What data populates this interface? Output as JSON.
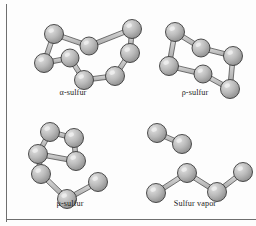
{
  "figure": {
    "background_color": "#fdfdfd",
    "rule_color": "#6e6e6e",
    "atom_color_light": "#e2e2e2",
    "atom_color_mid": "#b9b9b9",
    "atom_color_dark": "#8d8d8d",
    "atom_outline_color": "#3b3b3b",
    "bond_color_light": "#dcdcdc",
    "bond_color_dark": "#a6a6a6",
    "bond_outline_color": "#4a4a4a"
  },
  "panels": [
    {
      "id": "alpha-sulfur",
      "caption": "α-sulfur",
      "molecule": "S8 crown ring",
      "atom_count": 8,
      "atoms": [
        {
          "id": "a1",
          "cx": 36,
          "cy": 26,
          "r": 9.5
        },
        {
          "id": "a2",
          "cx": 26,
          "cy": 55,
          "r": 9.5
        },
        {
          "id": "a3",
          "cx": 52,
          "cy": 50,
          "r": 9.0
        },
        {
          "id": "a4",
          "cx": 66,
          "cy": 72,
          "r": 9.5
        },
        {
          "id": "a5",
          "cx": 97,
          "cy": 68,
          "r": 9.5
        },
        {
          "id": "a6",
          "cx": 112,
          "cy": 45,
          "r": 9.5
        },
        {
          "id": "a7",
          "cx": 71,
          "cy": 38,
          "r": 9.0
        },
        {
          "id": "a8",
          "cx": 114,
          "cy": 21,
          "r": 9.5
        }
      ],
      "bonds": [
        [
          "a1",
          "a2"
        ],
        [
          "a2",
          "a3"
        ],
        [
          "a3",
          "a4"
        ],
        [
          "a4",
          "a5"
        ],
        [
          "a5",
          "a6"
        ],
        [
          "a6",
          "a8"
        ],
        [
          "a8",
          "a7"
        ],
        [
          "a7",
          "a1"
        ]
      ]
    },
    {
      "id": "rho-sulfur",
      "caption": "ρ-sulfur",
      "molecule": "S6 chair ring",
      "atom_count": 6,
      "atoms": [
        {
          "id": "b1",
          "cx": 30,
          "cy": 24,
          "r": 9.5
        },
        {
          "id": "b2",
          "cx": 24,
          "cy": 58,
          "r": 9.5
        },
        {
          "id": "b3",
          "cx": 58,
          "cy": 66,
          "r": 9.0
        },
        {
          "id": "b4",
          "cx": 85,
          "cy": 81,
          "r": 9.5
        },
        {
          "id": "b5",
          "cx": 88,
          "cy": 48,
          "r": 9.5
        },
        {
          "id": "b6",
          "cx": 56,
          "cy": 40,
          "r": 9.0
        }
      ],
      "bonds": [
        [
          "b1",
          "b2"
        ],
        [
          "b2",
          "b3"
        ],
        [
          "b3",
          "b4"
        ],
        [
          "b4",
          "b5"
        ],
        [
          "b5",
          "b6"
        ],
        [
          "b6",
          "b1"
        ]
      ]
    },
    {
      "id": "mu-sulfur",
      "caption": "μ-sulfur",
      "molecule": "helical polymeric chain",
      "atom_count": 7,
      "atoms": [
        {
          "id": "c1",
          "cx": 28,
          "cy": 16,
          "r": 9.5
        },
        {
          "id": "c2",
          "cx": 16,
          "cy": 38,
          "r": 9.5
        },
        {
          "id": "c3",
          "cx": 52,
          "cy": 22,
          "r": 9.5
        },
        {
          "id": "c4",
          "cx": 54,
          "cy": 45,
          "r": 9.5
        },
        {
          "id": "c5",
          "cx": 19,
          "cy": 58,
          "r": 9.5
        },
        {
          "id": "c6",
          "cx": 45,
          "cy": 83,
          "r": 9.5
        },
        {
          "id": "c7",
          "cx": 76,
          "cy": 66,
          "r": 9.5
        }
      ],
      "bonds": [
        [
          "c1",
          "c2"
        ],
        [
          "c2",
          "c4"
        ],
        [
          "c3",
          "c4"
        ],
        [
          "c2",
          "c5"
        ],
        [
          "c5",
          "c6"
        ],
        [
          "c6",
          "c7"
        ],
        [
          "c3",
          "c1"
        ]
      ]
    },
    {
      "id": "sulfur-vapor",
      "caption": "Sulfur vapor",
      "molecule": "S2 diatomic and S4 chain",
      "atom_count": 6,
      "atoms": [
        {
          "id": "d1",
          "cx": 14,
          "cy": 17,
          "r": 9.5
        },
        {
          "id": "d2",
          "cx": 39,
          "cy": 28,
          "r": 9.5
        },
        {
          "id": "d3",
          "cx": 13,
          "cy": 77,
          "r": 9.5
        },
        {
          "id": "d4",
          "cx": 44,
          "cy": 57,
          "r": 9.5
        },
        {
          "id": "d5",
          "cx": 74,
          "cy": 76,
          "r": 9.5
        },
        {
          "id": "d6",
          "cx": 100,
          "cy": 56,
          "r": 9.5
        }
      ],
      "bonds": [
        [
          "d1",
          "d2"
        ],
        [
          "d3",
          "d4"
        ],
        [
          "d4",
          "d5"
        ],
        [
          "d5",
          "d6"
        ]
      ]
    }
  ]
}
